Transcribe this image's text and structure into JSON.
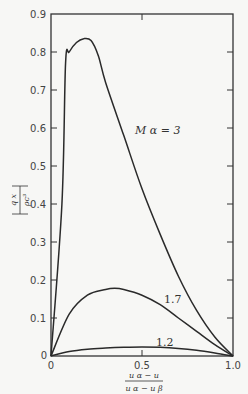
{
  "chart_data": {
    "type": "line",
    "title": "",
    "xlabel": "(u_α − u)/(u_α − u_β)",
    "ylabel": "|q_x / (ρ c³)|",
    "xlim": [
      0,
      1.0
    ],
    "ylim": [
      0,
      0.9
    ],
    "x_ticks": [
      "0",
      "0.5",
      "1.0"
    ],
    "y_ticks": [
      "0",
      "0.1",
      "0.2",
      "0.3",
      "0.4",
      "0.5",
      "0.6",
      "0.7",
      "0.8",
      "0.9"
    ],
    "grid": false,
    "legend": "inline labels",
    "series": [
      {
        "name": "M_α = 3",
        "label": "M α = 3",
        "x": [
          0,
          0.06,
          0.08,
          0.1,
          0.14,
          0.18,
          0.22,
          0.26,
          0.3,
          0.4,
          0.5,
          0.6,
          0.7,
          0.8,
          0.9,
          1.0
        ],
        "y": [
          0,
          0.4,
          0.77,
          0.8,
          0.825,
          0.835,
          0.83,
          0.79,
          0.72,
          0.58,
          0.44,
          0.32,
          0.21,
          0.12,
          0.05,
          0
        ]
      },
      {
        "name": "M_α = 1.7",
        "label": "1.7",
        "x": [
          0,
          0.1,
          0.2,
          0.3,
          0.35,
          0.4,
          0.5,
          0.6,
          0.7,
          0.8,
          0.9,
          1.0
        ],
        "y": [
          0,
          0.11,
          0.16,
          0.175,
          0.178,
          0.175,
          0.16,
          0.135,
          0.1,
          0.065,
          0.03,
          0
        ]
      },
      {
        "name": "M_α = 1.2",
        "label": "1.2",
        "x": [
          0,
          0.1,
          0.2,
          0.3,
          0.4,
          0.5,
          0.6,
          0.7,
          0.8,
          0.9,
          1.0
        ],
        "y": [
          0,
          0.012,
          0.018,
          0.021,
          0.023,
          0.024,
          0.023,
          0.02,
          0.015,
          0.008,
          0
        ]
      }
    ]
  },
  "axes": {
    "y_label_num": "q x",
    "y_label_den": "ρc³",
    "x_label_num": "u α − u",
    "x_label_den": "u α − u β",
    "origin_x": "0",
    "origin_y": "0"
  }
}
